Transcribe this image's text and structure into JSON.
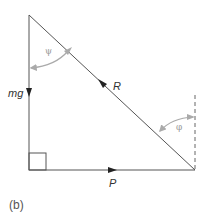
{
  "diagram": {
    "caption": "(b)",
    "type": "force triangle",
    "labels": {
      "weight": "mg",
      "reaction": "R",
      "push": "P",
      "angle_top": "ψ",
      "angle_right": "φ"
    },
    "colors": {
      "line": "#555555",
      "angle_arc": "#aaaaaa",
      "dashed": "#666666"
    }
  }
}
